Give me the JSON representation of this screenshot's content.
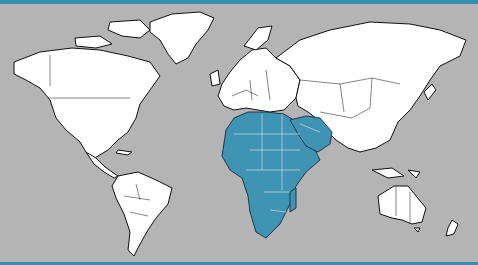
{
  "map": {
    "type": "world-political-outline",
    "ocean_color": "#b4b4b4",
    "land_color": "#ffffff",
    "highlight_color": "#3f93b3",
    "frame_accent_color": "#3a8fb0",
    "highlighted_region": "Africa and the Arabian Peninsula",
    "continents": [
      "North America",
      "South America",
      "Europe",
      "Asia",
      "Africa",
      "Australia",
      "Greenland",
      "Antarctica"
    ]
  }
}
